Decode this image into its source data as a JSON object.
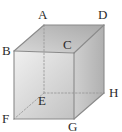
{
  "figure": {
    "name": "labeled-cube-diagram",
    "shape": "cube",
    "projection": "oblique",
    "background_color": "#ffffff",
    "stroke_color": "#8a8a8a",
    "hidden_stroke_color": "#9a9a9a",
    "label_color": "#2b2b2b",
    "faces": {
      "top": {
        "name": "top-face",
        "vertices": [
          "A",
          "D",
          "C",
          "B"
        ],
        "fill_light": "#d8d8d8",
        "fill_dark": "#a9a9a9"
      },
      "front": {
        "name": "front-face",
        "vertices": [
          "B",
          "C",
          "G",
          "F"
        ],
        "fill_light": "#f0f0f0",
        "fill_dark": "#c2c2c2"
      },
      "right": {
        "name": "right-face",
        "vertices": [
          "C",
          "D",
          "H",
          "G"
        ],
        "fill_light": "#cfcfcf",
        "fill_dark": "#b0b0b0"
      }
    },
    "vertices": [
      {
        "id": "A",
        "label": "A",
        "x": 44,
        "y": 25,
        "hidden": false,
        "label_x": 38,
        "label_y": 8
      },
      {
        "id": "B",
        "label": "B",
        "x": 14,
        "y": 51,
        "hidden": false,
        "label_x": 2,
        "label_y": 44
      },
      {
        "id": "C",
        "label": "C",
        "x": 74,
        "y": 53,
        "hidden": false,
        "label_x": 63,
        "label_y": 38
      },
      {
        "id": "D",
        "label": "D",
        "x": 104,
        "y": 25,
        "hidden": false,
        "label_x": 98,
        "label_y": 8
      },
      {
        "id": "E",
        "label": "E",
        "x": 44,
        "y": 93,
        "hidden": true,
        "label_x": 38,
        "label_y": 94
      },
      {
        "id": "F",
        "label": "F",
        "x": 14,
        "y": 119,
        "hidden": false,
        "label_x": 2,
        "label_y": 112
      },
      {
        "id": "G",
        "label": "G",
        "x": 74,
        "y": 119,
        "hidden": false,
        "label_x": 68,
        "label_y": 120
      },
      {
        "id": "H",
        "label": "H",
        "x": 104,
        "y": 93,
        "hidden": false,
        "label_x": 109,
        "label_y": 86
      }
    ],
    "visible_edges": [
      {
        "name": "edge-AB",
        "from": "A",
        "to": "B"
      },
      {
        "name": "edge-AD",
        "from": "A",
        "to": "D"
      },
      {
        "name": "edge-DC",
        "from": "D",
        "to": "C"
      },
      {
        "name": "edge-CB",
        "from": "C",
        "to": "B"
      },
      {
        "name": "edge-BF",
        "from": "B",
        "to": "F"
      },
      {
        "name": "edge-CG",
        "from": "C",
        "to": "G"
      },
      {
        "name": "edge-DH",
        "from": "D",
        "to": "H"
      },
      {
        "name": "edge-FG",
        "from": "F",
        "to": "G"
      },
      {
        "name": "edge-GH",
        "from": "G",
        "to": "H"
      }
    ],
    "hidden_edges": [
      {
        "name": "edge-AE",
        "from": "A",
        "to": "E"
      },
      {
        "name": "edge-EF",
        "from": "E",
        "to": "F"
      },
      {
        "name": "edge-EH",
        "from": "E",
        "to": "H"
      }
    ]
  }
}
